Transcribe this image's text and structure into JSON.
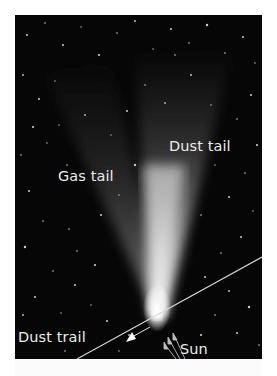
{
  "figure": {
    "labels": {
      "gas_tail": "Gas tail",
      "dust_tail": "Dust tail",
      "dust_trail": "Dust trail",
      "sun": "Sun"
    },
    "colors": {
      "background": "#060606",
      "label_text": "#ececec",
      "trail_line": "#d8d8d8",
      "page": "#ffffff"
    },
    "icons": {
      "motion_arrow": "arrow-down-left-icon",
      "sun_arrows": "arrow-up-left-icon"
    }
  }
}
